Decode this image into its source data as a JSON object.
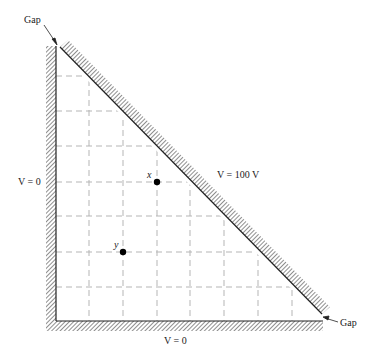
{
  "figure": {
    "labels": {
      "gap_top": "Gap",
      "gap_bottom": "Gap",
      "left_wall": "V = 0",
      "bottom_wall": "V = 0",
      "hypotenuse": "V = 100 V",
      "point_x": "x",
      "point_y": "y"
    },
    "grid": {
      "rows": 8,
      "cols": 8,
      "line_style": "dashed",
      "color": "#b0b0b0"
    },
    "boundaries": [
      {
        "name": "left-wall",
        "potential": "V = 0"
      },
      {
        "name": "bottom-wall",
        "potential": "V = 0"
      },
      {
        "name": "hypotenuse-wall",
        "potential": "V = 100 V"
      }
    ],
    "points": [
      {
        "name": "x",
        "grid_col": 3,
        "grid_row": 3
      },
      {
        "name": "y",
        "grid_col": 2,
        "grid_row": 5
      }
    ],
    "colors": {
      "wall": "#333333",
      "grid": "#b0b0b0",
      "point": "#000000"
    }
  }
}
